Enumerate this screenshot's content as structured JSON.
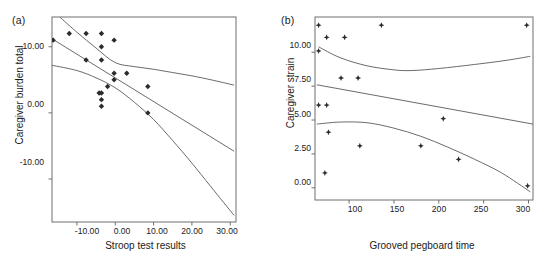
{
  "figure": {
    "panels": [
      {
        "key": "a",
        "label": "(a)",
        "xlabel": "Stroop test results",
        "ylabel": "Caregiver burden total",
        "xticks": [
          "-10.00",
          "0.00",
          "10.00",
          "20.00",
          "30.00"
        ],
        "yticks": [
          "10.00",
          "0.00",
          "-10.00"
        ]
      },
      {
        "key": "b",
        "label": "(b)",
        "xlabel": "Grooved pegboard time",
        "ylabel": "Caregiver strain",
        "xticks": [
          "100",
          "150",
          "200",
          "250",
          "300"
        ],
        "yticks": [
          "10.00",
          "7.50",
          "5.00",
          "2.50",
          "0.00"
        ]
      }
    ]
  },
  "chart_data": [
    {
      "type": "scatter",
      "panel": "(a)",
      "title": "",
      "xlabel": "Stroop test results",
      "ylabel": "Caregiver burden total",
      "xlim": [
        -16.5,
        31.5
      ],
      "ylim": [
        -16.5,
        14.5
      ],
      "xticks": [
        -10,
        0,
        10,
        20,
        30
      ],
      "yticks": [
        10,
        0,
        -10
      ],
      "grid": false,
      "legend": null,
      "marker": "filled-diamond",
      "points": [
        {
          "x": -16.2,
          "y": 11.0
        },
        {
          "x": -12.0,
          "y": 12.0
        },
        {
          "x": -7.6,
          "y": 12.0
        },
        {
          "x": -7.6,
          "y": 8.0
        },
        {
          "x": -3.6,
          "y": 12.0
        },
        {
          "x": -3.6,
          "y": 10.0
        },
        {
          "x": -3.6,
          "y": 8.0
        },
        {
          "x": -3.6,
          "y": 3.0
        },
        {
          "x": -4.2,
          "y": 3.0
        },
        {
          "x": -3.6,
          "y": 2.0
        },
        {
          "x": -3.6,
          "y": 1.0
        },
        {
          "x": -2.0,
          "y": 4.0
        },
        {
          "x": -0.3,
          "y": 11.0
        },
        {
          "x": -0.3,
          "y": 6.0
        },
        {
          "x": -0.3,
          "y": 5.0
        },
        {
          "x": 3.0,
          "y": 6.0
        },
        {
          "x": 8.5,
          "y": 4.0
        },
        {
          "x": 8.5,
          "y": 0.0
        }
      ],
      "fit_line": {
        "name": "regression line",
        "x": [
          -16.5,
          31.0
        ],
        "y": [
          11.2,
          -5.8
        ]
      },
      "confidence_bands": [
        {
          "name": "upper confidence band",
          "x": [
            -14.5,
            -10,
            -5,
            0,
            5,
            10,
            15,
            20,
            25,
            31.0
          ],
          "y": [
            14.5,
            12.2,
            9.8,
            7.6,
            7.0,
            6.6,
            6.1,
            5.6,
            5.0,
            4.2
          ]
        },
        {
          "name": "lower confidence band",
          "x": [
            -16.5,
            -10,
            -5,
            0,
            5,
            10,
            15,
            20,
            25,
            31.0
          ],
          "y": [
            7.2,
            6.4,
            5.3,
            3.8,
            1.6,
            -1.0,
            -4.2,
            -7.6,
            -11.2,
            -15.5
          ]
        }
      ]
    },
    {
      "type": "scatter",
      "panel": "(b)",
      "title": "",
      "xlabel": "Grooved pegboard time",
      "ylabel": "Caregiver strain",
      "xlim": [
        62,
        305
      ],
      "ylim": [
        -0.9,
        12.6
      ],
      "xticks": [
        100,
        150,
        200,
        250,
        300
      ],
      "yticks": [
        10.0,
        7.5,
        5.0,
        2.5,
        0.0
      ],
      "grid": false,
      "legend": null,
      "marker": "filled-star",
      "points": [
        {
          "x": 66,
          "y": 12.0
        },
        {
          "x": 66,
          "y": 10.1
        },
        {
          "x": 66,
          "y": 6.1
        },
        {
          "x": 75,
          "y": 11.1
        },
        {
          "x": 75,
          "y": 6.1
        },
        {
          "x": 77,
          "y": 4.1
        },
        {
          "x": 73,
          "y": 1.1
        },
        {
          "x": 91,
          "y": 8.1
        },
        {
          "x": 95,
          "y": 11.1
        },
        {
          "x": 110,
          "y": 8.1
        },
        {
          "x": 112,
          "y": 3.1
        },
        {
          "x": 136,
          "y": 12.0
        },
        {
          "x": 180,
          "y": 3.1
        },
        {
          "x": 205,
          "y": 5.1
        },
        {
          "x": 222,
          "y": 2.1
        },
        {
          "x": 298,
          "y": 12.0
        },
        {
          "x": 299,
          "y": 0.15
        }
      ],
      "fit_line": {
        "name": "regression line",
        "x": [
          64,
          305
        ],
        "y": [
          7.6,
          4.7
        ]
      },
      "confidence_bands": [
        {
          "name": "upper confidence band",
          "x": [
            66,
            90,
            120,
            150,
            170,
            200,
            240,
            275,
            302
          ],
          "y": [
            10.4,
            9.6,
            9.0,
            8.7,
            8.65,
            8.8,
            9.1,
            9.4,
            9.7
          ]
        },
        {
          "name": "lower confidence band",
          "x": [
            64,
            90,
            120,
            150,
            180,
            210,
            240,
            270,
            302
          ],
          "y": [
            4.7,
            4.85,
            4.8,
            4.4,
            3.8,
            3.0,
            2.1,
            1.1,
            -0.3
          ]
        }
      ]
    }
  ]
}
